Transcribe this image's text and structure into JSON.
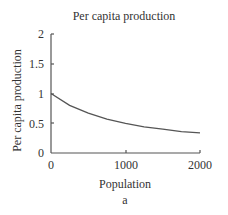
{
  "chart_data": {
    "type": "line",
    "title": "Per capita production",
    "xlabel": "Population",
    "ylabel": "Per capita production",
    "caption": "a",
    "xlim": [
      0,
      2000
    ],
    "ylim": [
      0,
      2
    ],
    "x_ticks": [
      "0",
      "1000",
      "2000"
    ],
    "y_ticks": [
      "0",
      "0.5",
      "1",
      "1.5",
      "2"
    ],
    "grid": false,
    "legend": null,
    "series": [
      {
        "name": "Per capita production",
        "x": [
          0,
          250,
          500,
          750,
          1000,
          1250,
          1500,
          1750,
          2000
        ],
        "values": [
          1.0,
          0.8,
          0.67,
          0.57,
          0.5,
          0.44,
          0.4,
          0.36,
          0.34
        ]
      }
    ],
    "line_color": "#555555"
  }
}
